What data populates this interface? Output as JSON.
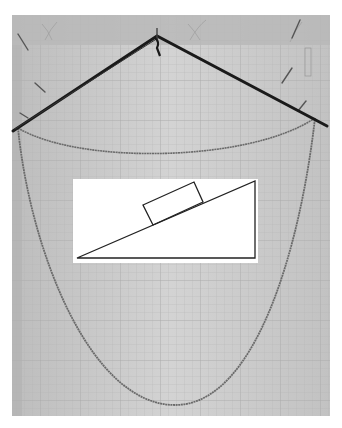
{
  "image": {
    "description": "Photograph of a physics demonstration: a bent dark rod hung from a pin with two chains hanging between its ends (a short catenary and a long deep catenary), and a white card with an inclined-plane diagram showing a block on a slope, mounted on grid paper.",
    "colors": {
      "background": "#ffffff",
      "paper": "#c9c9c9",
      "paper_light": "#d8d8d8",
      "wallpaper_band": "#b5b5b5",
      "grid": "#b0b0b0",
      "rod": "#1a1a1a",
      "chain": "#6a6a6a",
      "card": "#ffffff",
      "diagram_line": "#222222",
      "pin": "#555555"
    }
  },
  "diagram": {
    "label": "inclined-plane-with-block",
    "triangle": [
      [
        77,
        258
      ],
      [
        255,
        181
      ],
      [
        255,
        258
      ]
    ],
    "block": [
      [
        143,
        205
      ],
      [
        194,
        182
      ],
      [
        203,
        202
      ],
      [
        153,
        225
      ]
    ]
  }
}
